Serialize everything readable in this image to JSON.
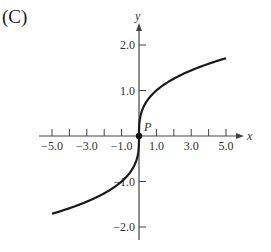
{
  "panel_label": "(C)",
  "chart_data": {
    "type": "line",
    "title": "",
    "xlabel": "x",
    "ylabel": "y",
    "function": "y = cbrt(x)",
    "xlim": [
      -5.0,
      5.0
    ],
    "ylim": [
      -2.0,
      2.0
    ],
    "x_ticks": [
      -5,
      -4,
      -3,
      -2,
      -1,
      1,
      2,
      3,
      4,
      5
    ],
    "x_tick_labels": [
      {
        "value": -5,
        "label": "-5.0"
      },
      {
        "value": -3,
        "label": "-3.0"
      },
      {
        "value": -1,
        "label": "-1.0"
      },
      {
        "value": 1,
        "label": "1.0"
      },
      {
        "value": 3,
        "label": "3.0"
      },
      {
        "value": 5,
        "label": "5.0"
      }
    ],
    "y_ticks": [
      {
        "value": 2,
        "label": "2.0"
      },
      {
        "value": 1,
        "label": "1.0"
      },
      {
        "value": -1,
        "label": "-1.0"
      },
      {
        "value": -2,
        "label": "-2.0"
      }
    ],
    "series": [
      {
        "name": "curve",
        "x": [
          -5,
          -4,
          -3,
          -2,
          -1,
          -0.5,
          -0.1,
          0,
          0.1,
          0.5,
          1,
          2,
          3,
          4,
          5
        ],
        "y": [
          -1.71,
          -1.59,
          -1.44,
          -1.26,
          -1.0,
          -0.79,
          -0.46,
          0,
          0.46,
          0.79,
          1.0,
          1.26,
          1.44,
          1.59,
          1.71
        ]
      }
    ],
    "annotations": [
      {
        "label": "P",
        "x": 0,
        "y": 0,
        "marker": "filled-circle"
      }
    ],
    "grid": false,
    "legend": null
  }
}
